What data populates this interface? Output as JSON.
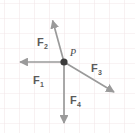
{
  "figure": {
    "name": "force-vector-diagram",
    "width": 135,
    "height": 133,
    "background_color": "#ffffff",
    "grid": {
      "line_color": "#f2e6e8",
      "spacing_px": 15,
      "origin_x": 4,
      "origin_y": 3,
      "visible": true
    },
    "point": {
      "label": "P",
      "x": 64,
      "y": 62,
      "radius": 3.6,
      "color": "#3b3b3b",
      "label_x": 70,
      "label_y": 55
    },
    "vector_color": "#9a9a9a",
    "vector_stroke_width": 1.6,
    "vectors": [
      {
        "id": "F1",
        "label": "F",
        "subscript": "1",
        "direction": "left",
        "tail_x": 64,
        "tail_y": 62,
        "tip_x": 17,
        "tip_y": 62,
        "label_x": 33,
        "label_y": 84,
        "sub_x": 41,
        "sub_y": 87
      },
      {
        "id": "F2",
        "label": "F",
        "subscript": "2",
        "direction": "up-left",
        "tail_x": 64,
        "tail_y": 62,
        "tip_x": 52,
        "tip_y": 18,
        "label_x": 37,
        "label_y": 46,
        "sub_x": 45,
        "sub_y": 49
      },
      {
        "id": "F3",
        "label": "F",
        "subscript": "3",
        "direction": "down-right",
        "tail_x": 64,
        "tail_y": 62,
        "tip_x": 117,
        "tip_y": 94,
        "label_x": 91,
        "label_y": 72,
        "sub_x": 99,
        "sub_y": 75
      },
      {
        "id": "F4",
        "label": "F",
        "subscript": "4",
        "direction": "down",
        "tail_x": 64,
        "tail_y": 62,
        "tip_x": 64,
        "tip_y": 126,
        "label_x": 70,
        "label_y": 104,
        "sub_x": 78,
        "sub_y": 107
      }
    ]
  }
}
